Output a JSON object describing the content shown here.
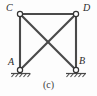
{
  "figure": {
    "caption": "(c)",
    "type": "truss-diagram",
    "background_color": "#fdfdfd",
    "member_color": "#4a4a4a",
    "joint_fill_color": "#ffffff",
    "joint_stroke_color": "#333333",
    "label_color": "#2b2b2b"
  },
  "joints": [
    {
      "id": "C",
      "label": "C",
      "x": 20,
      "y": 14,
      "support": "none"
    },
    {
      "id": "D",
      "label": "D",
      "x": 76,
      "y": 14,
      "support": "none"
    },
    {
      "id": "A",
      "label": "A",
      "x": 20,
      "y": 70,
      "support": "pin"
    },
    {
      "id": "B",
      "label": "B",
      "x": 76,
      "y": 70,
      "support": "pin"
    }
  ],
  "members": [
    {
      "id": "CD",
      "from": "C",
      "to": "D",
      "kind": "top-chord"
    },
    {
      "id": "CA",
      "from": "C",
      "to": "A",
      "kind": "left-vertical"
    },
    {
      "id": "DB",
      "from": "D",
      "to": "B",
      "kind": "right-vertical"
    },
    {
      "id": "CB",
      "from": "C",
      "to": "B",
      "kind": "diagonal"
    },
    {
      "id": "DA",
      "from": "D",
      "to": "A",
      "kind": "diagonal"
    }
  ],
  "supports": [
    {
      "joint": "A",
      "type": "pin",
      "ground_symbol": "hatched-line"
    },
    {
      "joint": "B",
      "type": "pin",
      "ground_symbol": "hatched-line"
    }
  ]
}
